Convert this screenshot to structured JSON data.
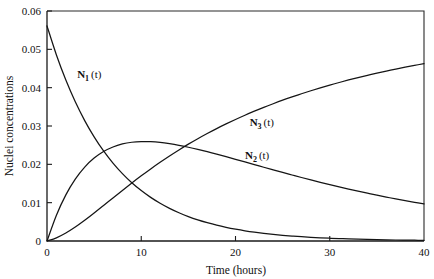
{
  "chart_data": {
    "type": "line",
    "title": "",
    "subtitle": "",
    "xlabel": "Time (hours)",
    "ylabel": "Nuclei concentrations",
    "xlim": [
      0,
      40
    ],
    "ylim": [
      0,
      0.06
    ],
    "xticks": [
      0,
      10,
      20,
      30,
      40
    ],
    "xtick_labels": [
      "0",
      "10",
      "20",
      "30",
      "40"
    ],
    "yticks": [
      0,
      0.01,
      0.02,
      0.03,
      0.04,
      0.05,
      0.06
    ],
    "ytick_labels": [
      "0",
      "0.01",
      "0.02",
      "0.03",
      "0.04",
      "0.05",
      "0.06"
    ],
    "grid": false,
    "legend": "inline-annotations",
    "line_color": "#151515",
    "annotations": [
      {
        "text": "N1 (t)",
        "base": "N",
        "sub": "1",
        "suffix": "(t)",
        "x": 3.2,
        "y": 0.0425
      },
      {
        "text": "N3 (t)",
        "base": "N",
        "sub": "3",
        "suffix": "(t)",
        "x": 21.5,
        "y": 0.03
      },
      {
        "text": "N2 (t)",
        "base": "N",
        "sub": "2",
        "suffix": "(t)",
        "x": 21.0,
        "y": 0.0214
      }
    ],
    "x": [
      0,
      1,
      2,
      3,
      4,
      5,
      6,
      7,
      8,
      9,
      10,
      11,
      12,
      13,
      14,
      15,
      16,
      17,
      18,
      19,
      20,
      21,
      22,
      23,
      24,
      25,
      26,
      27,
      28,
      29,
      30,
      31,
      32,
      33,
      34,
      35,
      36,
      37,
      38,
      39,
      40
    ],
    "series": [
      {
        "name": "N1 (t)",
        "label": "N1 (t)",
        "values": [
          0.0561,
          0.04853,
          0.04198,
          0.03631,
          0.03141,
          0.02717,
          0.0235,
          0.02033,
          0.01759,
          0.01521,
          0.01316,
          0.01138,
          0.00985,
          0.00852,
          0.00737,
          0.00637,
          0.00551,
          0.00477,
          0.00412,
          0.00357,
          0.00309,
          0.00267,
          0.00231,
          0.002,
          0.00173,
          0.00149,
          0.00129,
          0.00112,
          0.00097,
          0.00084,
          0.00072,
          0.00063,
          0.00054,
          0.00047,
          0.00041,
          0.00035,
          0.0003,
          0.00026,
          0.00023,
          0.0002,
          0.00017
        ]
      },
      {
        "name": "N2 (t)",
        "label": "N2 (t)",
        "values": [
          0.0,
          0.00674,
          0.01204,
          0.01615,
          0.01929,
          0.02163,
          0.02334,
          0.02453,
          0.02531,
          0.02576,
          0.02594,
          0.02591,
          0.02572,
          0.02539,
          0.02497,
          0.02446,
          0.0239,
          0.02329,
          0.02265,
          0.02199,
          0.02131,
          0.02062,
          0.01993,
          0.01924,
          0.01856,
          0.01788,
          0.01722,
          0.01657,
          0.01593,
          0.01531,
          0.01471,
          0.01412,
          0.01355,
          0.013,
          0.01247,
          0.01196,
          0.01146,
          0.01099,
          0.01053,
          0.01009,
          0.00966
        ]
      },
      {
        "name": "N3 (t)",
        "label": "N3 (t)",
        "values": [
          0.0,
          0.00083,
          0.00208,
          0.00364,
          0.0054,
          0.0073,
          0.00926,
          0.01124,
          0.0132,
          0.01513,
          0.017,
          0.01881,
          0.02053,
          0.02219,
          0.02376,
          0.02527,
          0.02669,
          0.02804,
          0.02933,
          0.03054,
          0.0317,
          0.03281,
          0.03386,
          0.03486,
          0.03581,
          0.03673,
          0.03759,
          0.03841,
          0.0392,
          0.03995,
          0.04067,
          0.04135,
          0.04201,
          0.04263,
          0.04322,
          0.04379,
          0.04434,
          0.04485,
          0.04534,
          0.04581,
          0.04627
        ]
      }
    ]
  }
}
